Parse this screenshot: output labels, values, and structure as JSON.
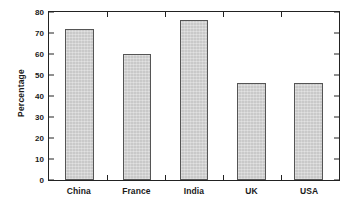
{
  "chart_data": {
    "type": "bar",
    "title": "",
    "subtitle": "",
    "xlabel": "",
    "ylabel": "Percentage",
    "categories": [
      "China",
      "France",
      "India",
      "UK",
      "USA"
    ],
    "values": [
      72,
      60,
      76,
      46,
      46
    ],
    "series": [
      {
        "name": "Percentage",
        "values": [
          72,
          60,
          76,
          46,
          46
        ]
      }
    ],
    "ylim": [
      0,
      80
    ],
    "y_ticks": [
      0,
      10,
      20,
      30,
      40,
      50,
      60,
      70,
      80
    ],
    "y_tick_labels": [
      "0",
      "10",
      "20",
      "30",
      "40",
      "50",
      "60",
      "70",
      "80"
    ],
    "grid": false,
    "legend": false,
    "legend_position": "none",
    "annotations": [],
    "bar_fill_color": "#c9c9c9",
    "bar_border_color": "#555555",
    "axis_color": "#222222",
    "background_color": "#ffffff",
    "text_color": "#1a1a1a"
  }
}
